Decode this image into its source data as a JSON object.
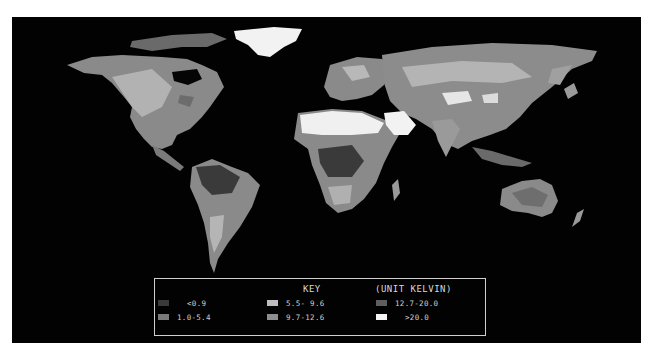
{
  "map": {
    "title": "World map (Kelvin scale)",
    "projection": "equirectangular",
    "background_color": "#020202",
    "frame_color": "#ffffff"
  },
  "legend": {
    "title": "KEY",
    "unit": "(UNIT KELVIN)",
    "items": [
      {
        "label": "<0.9",
        "color": "#3a3a3a"
      },
      {
        "label": "1.0-5.4",
        "color": "#7a7a7a"
      },
      {
        "label": "5.5- 9.6",
        "color": "#bdbdbd"
      },
      {
        "label": "9.7-12.6",
        "color": "#8e8e8e"
      },
      {
        "label": "12.7-20.0",
        "color": "#5e5e5e"
      },
      {
        "label": ">20.0",
        "color": "#f4f4f4"
      }
    ]
  }
}
